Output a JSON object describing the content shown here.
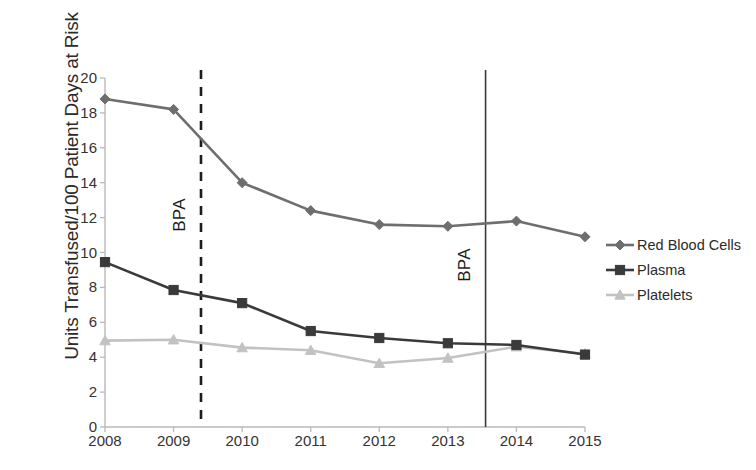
{
  "chart_data": {
    "type": "line",
    "title": "",
    "xlabel": "",
    "ylabel": "Units Transfused/100 Patient Days at Risk",
    "categories": [
      "2008",
      "2009",
      "2010",
      "2011",
      "2012",
      "2013",
      "2014",
      "2015"
    ],
    "x": [
      2008,
      2009,
      2010,
      2011,
      2012,
      2013,
      2014,
      2015
    ],
    "ylim": [
      0,
      20
    ],
    "yticks": [
      0,
      2,
      4,
      6,
      8,
      10,
      12,
      14,
      16,
      18,
      20
    ],
    "grid": false,
    "legend_position": "right",
    "series": [
      {
        "name": "Red Blood Cells",
        "color": "#6e6e6e",
        "marker": "diamond",
        "values": [
          18.8,
          18.2,
          14.0,
          12.4,
          11.6,
          11.5,
          11.8,
          10.9
        ]
      },
      {
        "name": "Plasma",
        "color": "#3a3a3a",
        "marker": "square",
        "values": [
          9.45,
          7.85,
          7.1,
          5.5,
          5.1,
          4.8,
          4.7,
          4.15
        ]
      },
      {
        "name": "Platelets",
        "color": "#c2c2c2",
        "marker": "triangle",
        "values": [
          4.95,
          5.0,
          4.55,
          4.4,
          3.65,
          3.95,
          4.6,
          4.2
        ]
      }
    ],
    "annotations": [
      {
        "label": "BPA",
        "x": 2009.4,
        "style": "dashed",
        "color": "#1d1d1d"
      },
      {
        "label": "BPA",
        "x": 2013.55,
        "style": "solid",
        "color": "#3a3a3a"
      }
    ]
  },
  "legend": {
    "items": [
      {
        "label": "Red Blood Cells"
      },
      {
        "label": "Plasma"
      },
      {
        "label": "Platelets"
      }
    ]
  },
  "axes": {
    "y_title": "Units Transfused/100 Patient Days at Risk",
    "y_tick_labels": [
      "20",
      "18",
      "16",
      "14",
      "12",
      "10",
      "8",
      "6",
      "4",
      "2",
      "0"
    ],
    "x_tick_labels": [
      "2008",
      "2009",
      "2010",
      "2011",
      "2012",
      "2013",
      "2014",
      "2015"
    ]
  },
  "annotations": {
    "bpa_dashed_label": "BPA",
    "bpa_solid_label": "BPA"
  }
}
